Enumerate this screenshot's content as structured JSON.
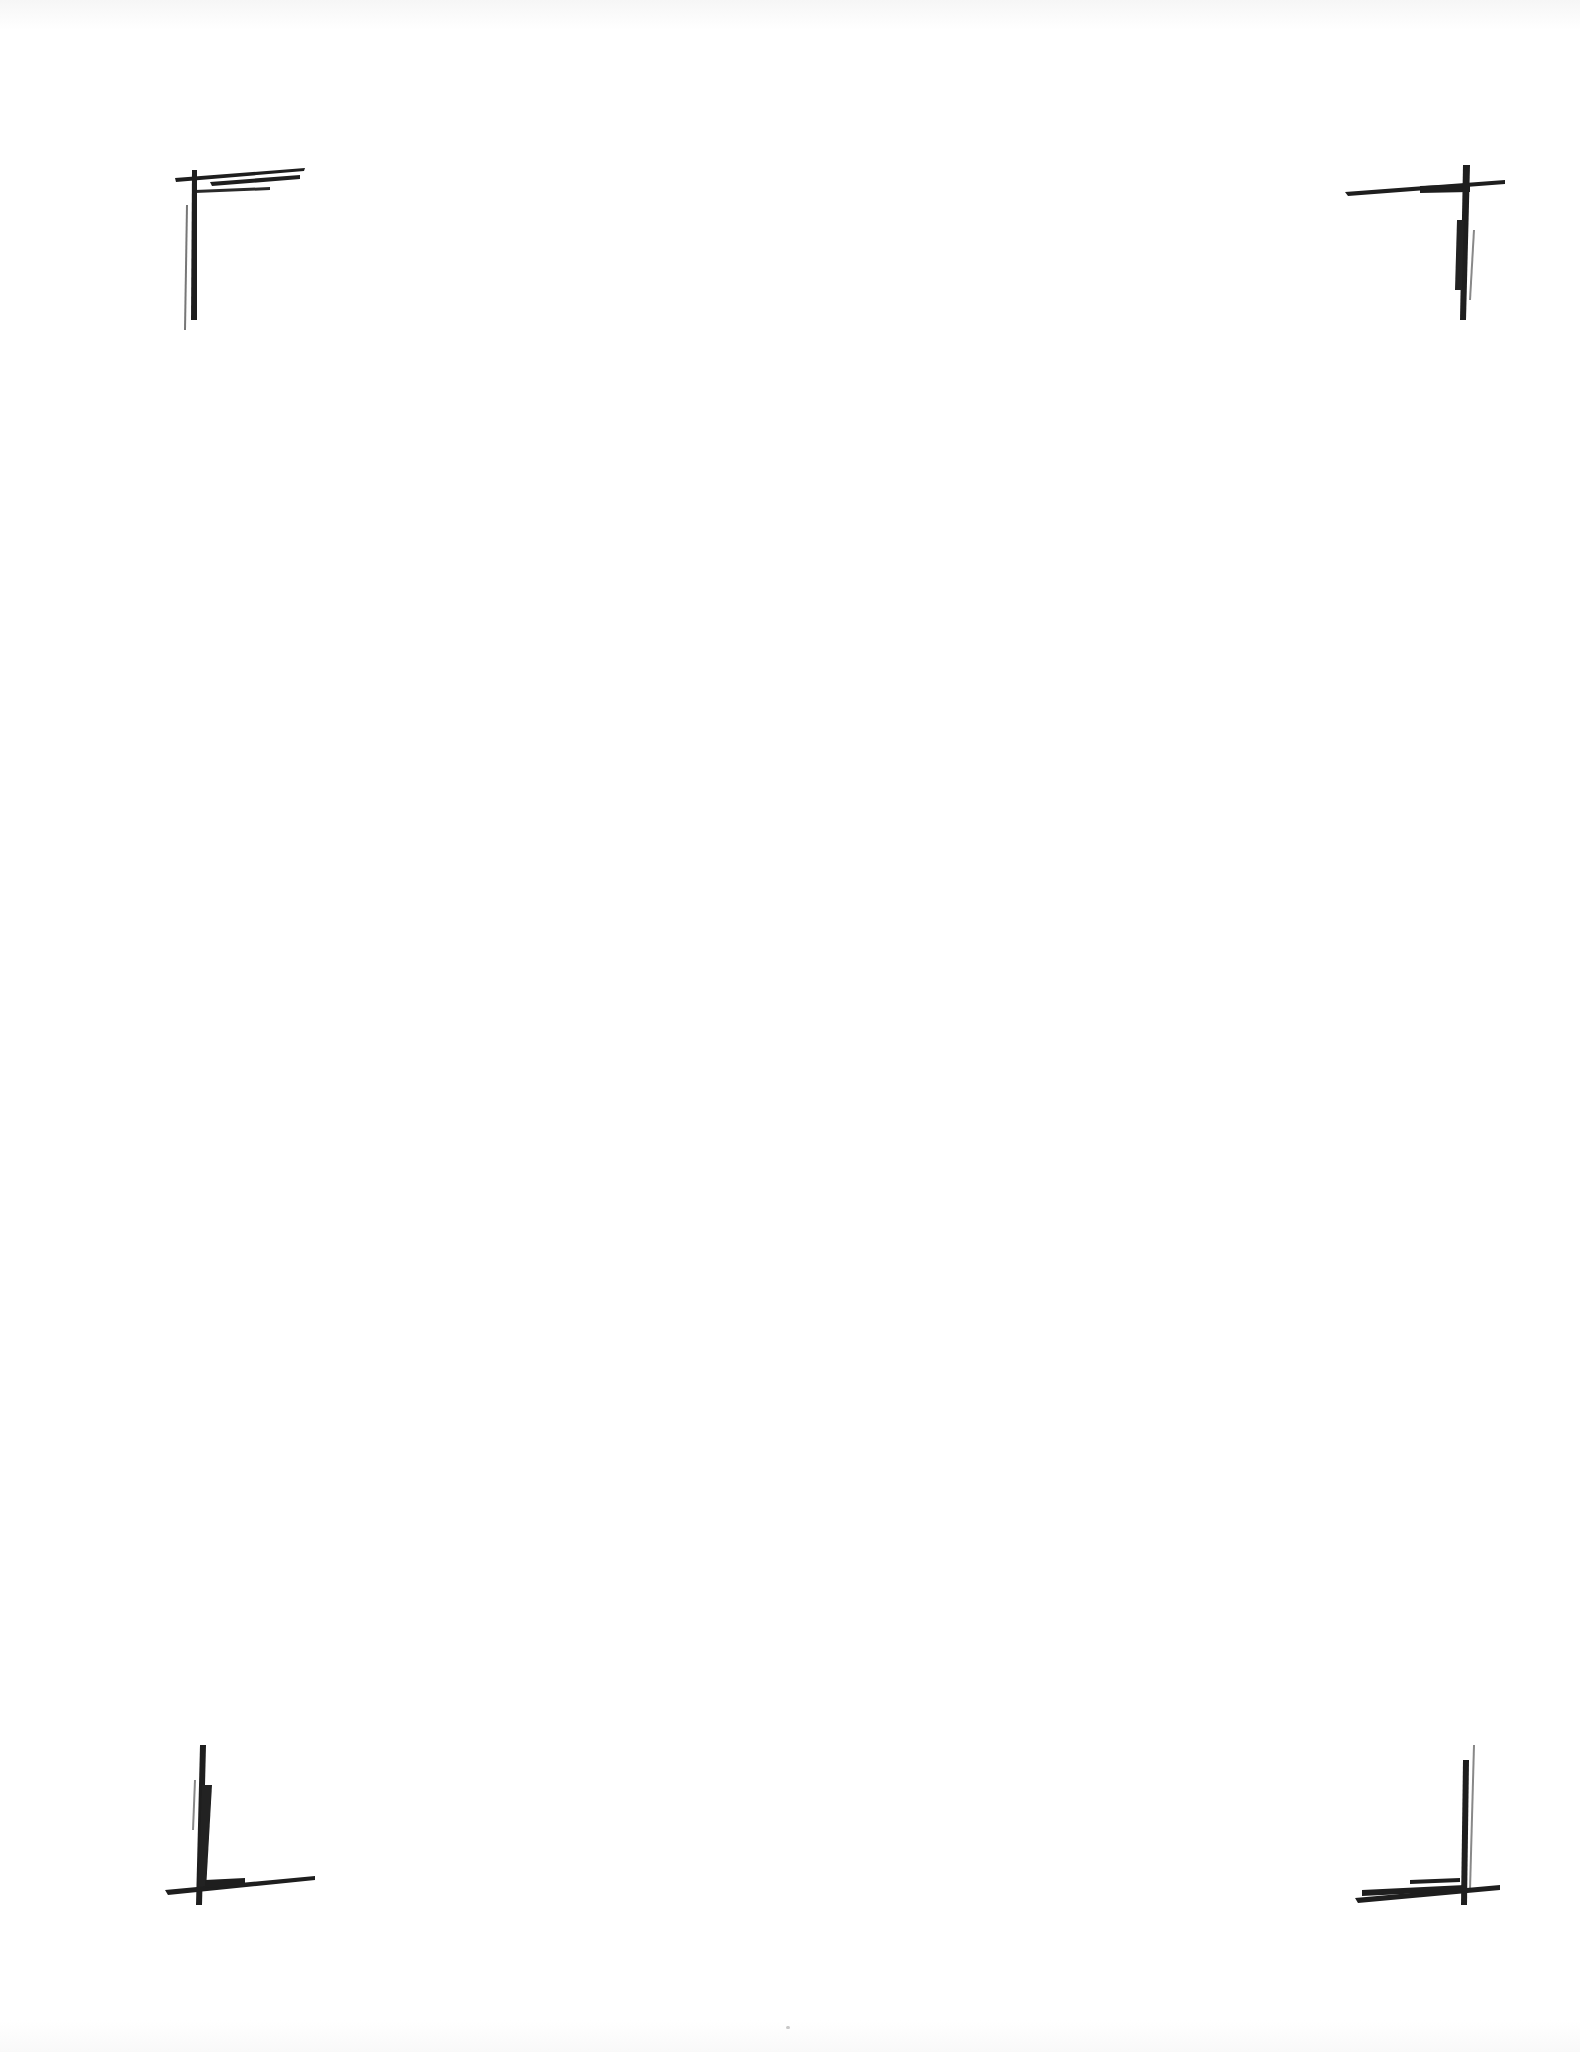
{
  "document": {
    "type": "blank scanned page",
    "background_color": "#ffffff",
    "mark_color": "#1e1e1e",
    "crop_marks": [
      {
        "position": "top-left"
      },
      {
        "position": "top-right"
      },
      {
        "position": "bottom-left"
      },
      {
        "position": "bottom-right"
      }
    ]
  }
}
